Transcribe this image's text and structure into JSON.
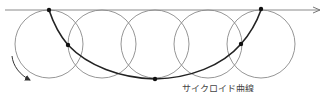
{
  "diagram": {
    "caption": "サイクロイド曲線",
    "circle_count": 5,
    "colors": {
      "circle": "#8a8a8a",
      "baseline": "#8a8a8a",
      "curve": "#222222",
      "point": "#111111",
      "rotation_arrow": "#333333"
    },
    "labels": {
      "baseline_arrow": "rolling line (direction →)",
      "rotation_arrow": "rotation direction"
    }
  }
}
